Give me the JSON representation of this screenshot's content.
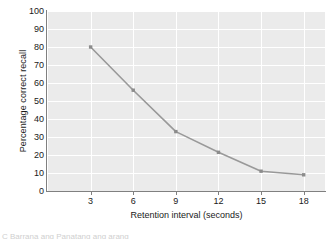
{
  "chart_data": {
    "type": "line",
    "title": "",
    "xlabel": "Retention interval (seconds)",
    "ylabel": "Percentage correct recall",
    "x": [
      3,
      6,
      9,
      12,
      15,
      18
    ],
    "values": [
      80,
      56,
      33,
      21.5,
      11,
      9
    ],
    "series": [
      {
        "name": "Percentage correct recall",
        "values": [
          80,
          56,
          33,
          21.5,
          11,
          9
        ]
      }
    ],
    "xlim": [
      0,
      19.5
    ],
    "ylim": [
      0,
      100
    ],
    "xticks": [
      "3",
      "6",
      "9",
      "12",
      "15",
      "18"
    ],
    "yticks": [
      "0",
      "10",
      "20",
      "30",
      "40",
      "50",
      "60",
      "70",
      "80",
      "90",
      "100"
    ],
    "grid": true,
    "legend": false,
    "legend_position": "none",
    "marker": "square",
    "line_color": "#999999",
    "marker_color": "#8c8c8c",
    "plot_background": "#ebebeb",
    "grid_color": "#ffffff",
    "axis_color": "#808080",
    "text_color": "#1a1a1a"
  },
  "figure": {
    "bottom_caption_fragment": "C Barrana ang Panatang ang arang"
  }
}
